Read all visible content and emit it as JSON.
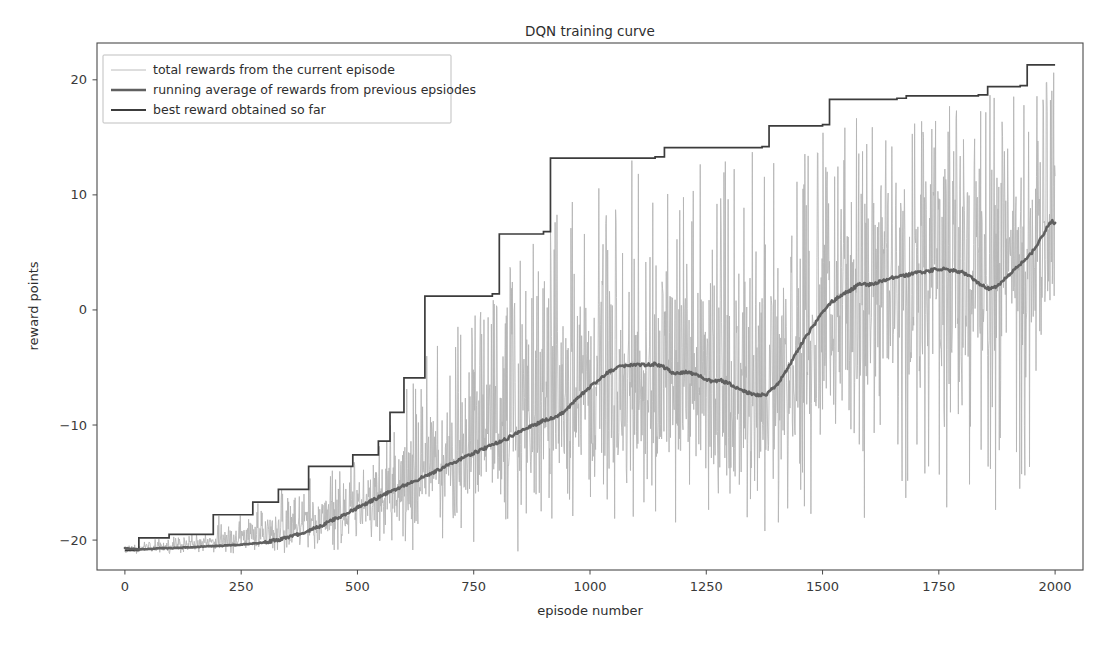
{
  "chart_data": {
    "type": "line",
    "title": "DQN training curve",
    "xlabel": "episode number",
    "ylabel": "reward points",
    "xlim": [
      -60,
      2060
    ],
    "ylim": [
      -22.6,
      23.2
    ],
    "xticks": [
      0,
      250,
      500,
      750,
      1000,
      1250,
      1500,
      1750,
      2000
    ],
    "xticklabels": [
      "0",
      "250",
      "500",
      "750",
      "1000",
      "1250",
      "1500",
      "1750",
      "2000"
    ],
    "yticks": [
      -20,
      -10,
      0,
      10,
      20
    ],
    "yticklabels": [
      "−20",
      "−10",
      "0",
      "10",
      "20"
    ],
    "grid": false,
    "legend_position": "upper left",
    "series": [
      {
        "name": "total rewards from the current episode",
        "key": "episode_rewards",
        "color": "#b4b4b4",
        "linewidth": 0.85,
        "description": "Per-episode total reward, noisy; rises from about -21 early to a band spanning roughly -19 to +21 by episode 2000.",
        "x_start": 0,
        "x_end": 2000,
        "noise_envelope": [
          {
            "episode": 0,
            "mean": -20.6,
            "spread_low": -21.2,
            "spread_high": -19.6
          },
          {
            "episode": 150,
            "mean": -20.3,
            "spread_low": -21.2,
            "spread_high": -17.8
          },
          {
            "episode": 300,
            "mean": -19.6,
            "spread_low": -21.2,
            "spread_high": -15.0
          },
          {
            "episode": 450,
            "mean": -17.6,
            "spread_low": -21.2,
            "spread_high": -10.6
          },
          {
            "episode": 600,
            "mean": -14.8,
            "spread_low": -21.2,
            "spread_high": -5.6
          },
          {
            "episode": 750,
            "mean": -11.4,
            "spread_low": -21.2,
            "spread_high": 1.0
          },
          {
            "episode": 900,
            "mean": -7.6,
            "spread_low": -21.2,
            "spread_high": 8.0
          },
          {
            "episode": 1050,
            "mean": -5.1,
            "spread_low": -21.2,
            "spread_high": 13.2
          },
          {
            "episode": 1200,
            "mean": -5.3,
            "spread_low": -21.2,
            "spread_high": 13.3
          },
          {
            "episode": 1350,
            "mean": -7.2,
            "spread_low": -21.2,
            "spread_high": 14.1
          },
          {
            "episode": 1500,
            "mean": -1.2,
            "spread_low": -21.2,
            "spread_high": 16.0
          },
          {
            "episode": 1650,
            "mean": 2.9,
            "spread_low": -21.2,
            "spread_high": 18.3
          },
          {
            "episode": 1800,
            "mean": 3.4,
            "spread_low": -21.2,
            "spread_high": 18.6
          },
          {
            "episode": 1950,
            "mean": 5.6,
            "spread_low": -19.0,
            "spread_high": 19.4
          },
          {
            "episode": 2000,
            "mean": 7.5,
            "spread_low": -9.0,
            "spread_high": 21.3
          }
        ]
      },
      {
        "name": "running average of rewards from previous epsiodes",
        "key": "running_average",
        "color": "#606060",
        "linewidth": 2.6,
        "description": "Smoothed moving average of episode rewards.",
        "points": [
          [
            0,
            -20.7
          ],
          [
            25,
            -20.8
          ],
          [
            50,
            -20.8
          ],
          [
            75,
            -20.7
          ],
          [
            100,
            -20.7
          ],
          [
            150,
            -20.6
          ],
          [
            200,
            -20.5
          ],
          [
            250,
            -20.4
          ],
          [
            300,
            -20.2
          ],
          [
            340,
            -19.9
          ],
          [
            380,
            -19.4
          ],
          [
            420,
            -18.8
          ],
          [
            460,
            -18.0
          ],
          [
            500,
            -17.2
          ],
          [
            540,
            -16.4
          ],
          [
            580,
            -15.6
          ],
          [
            620,
            -14.9
          ],
          [
            660,
            -14.2
          ],
          [
            700,
            -13.4
          ],
          [
            740,
            -12.6
          ],
          [
            780,
            -11.9
          ],
          [
            820,
            -11.2
          ],
          [
            860,
            -10.3
          ],
          [
            880,
            -10.0
          ],
          [
            900,
            -9.6
          ],
          [
            920,
            -9.4
          ],
          [
            940,
            -9.0
          ],
          [
            960,
            -8.2
          ],
          [
            980,
            -7.4
          ],
          [
            1000,
            -6.7
          ],
          [
            1020,
            -6.0
          ],
          [
            1040,
            -5.4
          ],
          [
            1060,
            -5.0
          ],
          [
            1080,
            -4.8
          ],
          [
            1100,
            -4.7
          ],
          [
            1120,
            -4.8
          ],
          [
            1140,
            -4.7
          ],
          [
            1160,
            -5.0
          ],
          [
            1180,
            -5.5
          ],
          [
            1200,
            -5.4
          ],
          [
            1220,
            -5.5
          ],
          [
            1240,
            -5.8
          ],
          [
            1260,
            -6.2
          ],
          [
            1280,
            -6.1
          ],
          [
            1300,
            -6.4
          ],
          [
            1320,
            -6.9
          ],
          [
            1340,
            -7.2
          ],
          [
            1360,
            -7.4
          ],
          [
            1380,
            -7.3
          ],
          [
            1400,
            -6.6
          ],
          [
            1420,
            -5.4
          ],
          [
            1440,
            -4.0
          ],
          [
            1460,
            -2.6
          ],
          [
            1480,
            -1.4
          ],
          [
            1500,
            -0.2
          ],
          [
            1520,
            0.7
          ],
          [
            1540,
            1.3
          ],
          [
            1560,
            1.7
          ],
          [
            1580,
            2.3
          ],
          [
            1600,
            2.2
          ],
          [
            1620,
            2.4
          ],
          [
            1640,
            2.7
          ],
          [
            1660,
            2.9
          ],
          [
            1680,
            3.0
          ],
          [
            1700,
            3.2
          ],
          [
            1720,
            3.3
          ],
          [
            1740,
            3.5
          ],
          [
            1760,
            3.6
          ],
          [
            1780,
            3.4
          ],
          [
            1800,
            3.3
          ],
          [
            1820,
            2.8
          ],
          [
            1840,
            2.2
          ],
          [
            1860,
            1.8
          ],
          [
            1880,
            2.2
          ],
          [
            1900,
            3.0
          ],
          [
            1920,
            3.8
          ],
          [
            1940,
            4.5
          ],
          [
            1960,
            5.5
          ],
          [
            1975,
            6.6
          ],
          [
            1985,
            7.4
          ],
          [
            1995,
            7.7
          ],
          [
            2000,
            7.5
          ]
        ]
      },
      {
        "name": "best reward obtained so far",
        "key": "best_reward",
        "color": "#3c3c3c",
        "linewidth": 1.7,
        "description": "Monotonic step function of the running best episode reward.",
        "steps": [
          [
            0,
            -20.9
          ],
          [
            30,
            -19.8
          ],
          [
            95,
            -19.5
          ],
          [
            190,
            -17.8
          ],
          [
            275,
            -16.7
          ],
          [
            330,
            -15.6
          ],
          [
            395,
            -13.6
          ],
          [
            490,
            -12.6
          ],
          [
            545,
            -11.4
          ],
          [
            570,
            -8.9
          ],
          [
            600,
            -5.9
          ],
          [
            645,
            1.2
          ],
          [
            790,
            1.4
          ],
          [
            805,
            6.6
          ],
          [
            900,
            6.8
          ],
          [
            915,
            13.2
          ],
          [
            1140,
            13.3
          ],
          [
            1160,
            14.1
          ],
          [
            1370,
            14.2
          ],
          [
            1385,
            16.0
          ],
          [
            1500,
            16.1
          ],
          [
            1515,
            18.3
          ],
          [
            1660,
            18.4
          ],
          [
            1680,
            18.6
          ],
          [
            1835,
            18.7
          ],
          [
            1855,
            19.4
          ],
          [
            1925,
            19.5
          ],
          [
            1940,
            21.3
          ],
          [
            2000,
            21.3
          ]
        ]
      }
    ]
  },
  "axes": {
    "title": "DQN training curve",
    "xlabel": "episode number",
    "ylabel": "reward points"
  },
  "legend": {
    "entries": [
      {
        "label": "total rewards from the current episode",
        "color": "#b4b4b4",
        "width": 0.9
      },
      {
        "label": "running average of rewards from previous epsiodes",
        "color": "#606060",
        "width": 2.6
      },
      {
        "label": "best reward obtained so far",
        "color": "#3c3c3c",
        "width": 1.8
      }
    ]
  },
  "colors": {
    "background": "#ffffff",
    "frame": "#4a4a4a",
    "text": "#2e2e2e",
    "episode": "#b4b4b4",
    "running": "#606060",
    "best": "#3c3c3c"
  }
}
